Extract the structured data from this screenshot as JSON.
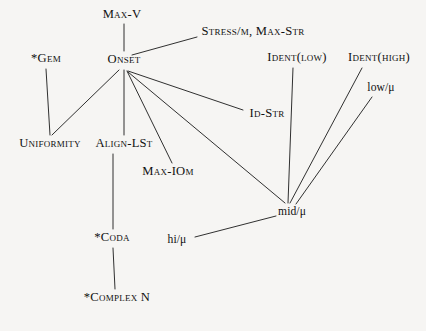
{
  "diagram": {
    "background_color": "#f6f5f3",
    "line_color": "#1a1a1a",
    "text_color": "#101010",
    "width": 426,
    "height": 331
  },
  "nodes": {
    "max_v": {
      "label": "Max-V",
      "style": "smallcaps",
      "x": 122,
      "y": 15
    },
    "stress_mu_max_str": {
      "label": "Stress/μ,  Max-Str",
      "style": "mixed",
      "x": 253,
      "y": 32
    },
    "gem": {
      "label": "*Gem",
      "style": "smallcaps",
      "x": 46,
      "y": 59
    },
    "onset": {
      "label": "Onset",
      "style": "smallcaps",
      "x": 124,
      "y": 60
    },
    "ident_low": {
      "label": "Ident(low)",
      "style": "mixed",
      "x": 297,
      "y": 58
    },
    "ident_high": {
      "label": "Ident(high)",
      "style": "mixed",
      "x": 379,
      "y": 58
    },
    "low_mu": {
      "label": "low/μ",
      "style": "plain",
      "x": 381,
      "y": 88
    },
    "id_str": {
      "label": "Id-Str",
      "style": "smallcaps",
      "x": 267,
      "y": 114
    },
    "uniformity": {
      "label": "Uniformity",
      "style": "smallcaps",
      "x": 50,
      "y": 144
    },
    "align_lst": {
      "label": "Align-LSt",
      "style": "smallcaps",
      "x": 124,
      "y": 144
    },
    "max_iomu": {
      "label": "Max-IOμ",
      "style": "mixed",
      "x": 168,
      "y": 172
    },
    "mid_mu": {
      "label": "mid/μ",
      "style": "plain",
      "x": 292,
      "y": 212
    },
    "hi_mu": {
      "label": "hi/μ",
      "style": "plain",
      "x": 177,
      "y": 240
    },
    "coda": {
      "label": "*Coda",
      "style": "smallcaps",
      "x": 112,
      "y": 238
    },
    "complex_n": {
      "label": "*Complex N",
      "style": "smallcaps",
      "x": 117,
      "y": 298
    }
  },
  "edges": [
    {
      "name": "max-v-to-onset",
      "from": "max_v",
      "to": "onset",
      "x1": 124,
      "y1": 24,
      "x2": 124,
      "y2": 51
    },
    {
      "name": "onset-to-stress-mu",
      "from": "onset",
      "to": "stress_mu_max_str",
      "x1": 132,
      "y1": 55,
      "x2": 197,
      "y2": 37
    },
    {
      "name": "gem-to-uniformity",
      "from": "gem",
      "to": "uniformity",
      "x1": 46,
      "y1": 69,
      "x2": 50,
      "y2": 135
    },
    {
      "name": "onset-to-uniformity",
      "from": "onset",
      "to": "uniformity",
      "x1": 119,
      "y1": 70,
      "x2": 52,
      "y2": 135
    },
    {
      "name": "onset-to-align-lst",
      "from": "onset",
      "to": "align_lst",
      "x1": 124,
      "y1": 70,
      "x2": 124,
      "y2": 135
    },
    {
      "name": "onset-to-max-iomu",
      "from": "onset",
      "to": "max_iomu",
      "x1": 127,
      "y1": 71,
      "x2": 172,
      "y2": 163
    },
    {
      "name": "onset-to-id-str",
      "from": "onset",
      "to": "id_str",
      "x1": 128,
      "y1": 71,
      "x2": 243,
      "y2": 110
    },
    {
      "name": "onset-to-mid-mu",
      "from": "onset",
      "to": "mid_mu",
      "x1": 128,
      "y1": 72,
      "x2": 285,
      "y2": 203
    },
    {
      "name": "ident-low-to-mid-mu",
      "from": "ident_low",
      "to": "mid_mu",
      "x1": 293,
      "y1": 68,
      "x2": 288,
      "y2": 203
    },
    {
      "name": "ident-high-to-mid-mu",
      "from": "ident_high",
      "to": "mid_mu",
      "x1": 362,
      "y1": 68,
      "x2": 290,
      "y2": 203
    },
    {
      "name": "low-mu-to-mid-mu",
      "from": "low_mu",
      "to": "mid_mu",
      "x1": 372,
      "y1": 97,
      "x2": 296,
      "y2": 204
    },
    {
      "name": "hi-mu-to-mid-mu",
      "from": "hi_mu",
      "to": "mid_mu",
      "x1": 195,
      "y1": 237,
      "x2": 276,
      "y2": 216
    },
    {
      "name": "align-lst-to-coda",
      "from": "align_lst",
      "to": "coda",
      "x1": 113,
      "y1": 154,
      "x2": 113,
      "y2": 229
    },
    {
      "name": "coda-to-complex-n",
      "from": "coda",
      "to": "complex_n",
      "x1": 113,
      "y1": 248,
      "x2": 115,
      "y2": 289
    }
  ]
}
